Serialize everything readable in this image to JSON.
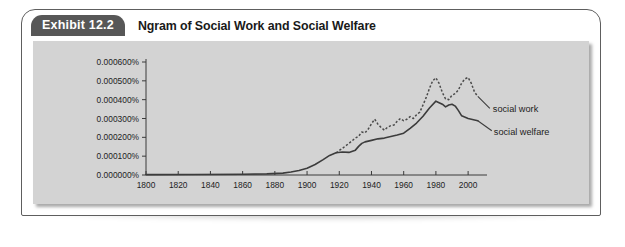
{
  "exhibit": {
    "tab_label": "Exhibit 12.2",
    "title": "Ngram of Social Work and Social Welfare"
  },
  "colors": {
    "card_background": "#ffffff",
    "card_border": "#5e5e5e",
    "tab_background": "#575757",
    "tab_text": "#ffffff",
    "panel_background": "#d3d3d3",
    "axis": "#3a3a3a",
    "social_welfare_line": "#3c3c3c",
    "social_work_line": "#4a4a4a"
  },
  "chart_data": {
    "type": "line",
    "title": "Ngram of Social Work and Social Welfare",
    "xlabel": "",
    "ylabel": "",
    "xlim": [
      1800,
      2008
    ],
    "ylim": [
      0,
      0.0006
    ],
    "grid": false,
    "legend_position": "right-inline-labels",
    "x_tick_labels": [
      "1800",
      "1820",
      "1840",
      "1860",
      "1880",
      "1900",
      "1920",
      "1940",
      "1960",
      "1980",
      "2000"
    ],
    "x_ticks": [
      1800,
      1820,
      1840,
      1860,
      1880,
      1900,
      1920,
      1940,
      1960,
      1980,
      2000
    ],
    "y_tick_labels": [
      "0.000000%",
      "0.000100%",
      "0.000200%",
      "0.000300%",
      "0.000400%",
      "0.000500%",
      "0.000600%"
    ],
    "y_ticks": [
      0,
      0.0001,
      0.0002,
      0.0003,
      0.0004,
      0.0005,
      0.0006
    ],
    "series": [
      {
        "name": "social work",
        "style": "dotted",
        "label": "social work",
        "x": [
          1918,
          1922,
          1926,
          1930,
          1932,
          1934,
          1936,
          1938,
          1940,
          1942,
          1944,
          1946,
          1948,
          1950,
          1952,
          1954,
          1956,
          1958,
          1960,
          1962,
          1964,
          1966,
          1968,
          1970,
          1972,
          1974,
          1976,
          1978,
          1980,
          1982,
          1984,
          1986,
          1988,
          1990,
          1992,
          1994,
          1996,
          1998,
          2000,
          2002,
          2004,
          2006
        ],
        "y": [
          0.000118,
          0.000142,
          0.000168,
          0.000196,
          0.000206,
          0.000228,
          0.000224,
          0.000244,
          0.000272,
          0.000296,
          0.00027,
          0.000252,
          0.000238,
          0.000254,
          0.000262,
          0.000266,
          0.000286,
          0.0003,
          0.000288,
          0.000296,
          0.00031,
          0.0003,
          0.00032,
          0.000334,
          0.000372,
          0.000412,
          0.00046,
          0.0005,
          0.000516,
          0.000486,
          0.000438,
          0.000404,
          0.0004,
          0.000424,
          0.000432,
          0.000452,
          0.000488,
          0.00051,
          0.000518,
          0.000486,
          0.00044,
          0.000418
        ]
      },
      {
        "name": "social welfare",
        "style": "solid",
        "label": "social welfare",
        "x": [
          1800,
          1830,
          1860,
          1875,
          1885,
          1890,
          1895,
          1900,
          1905,
          1910,
          1914,
          1918,
          1922,
          1926,
          1930,
          1932,
          1934,
          1936,
          1938,
          1940,
          1944,
          1948,
          1952,
          1956,
          1960,
          1964,
          1968,
          1972,
          1976,
          1980,
          1984,
          1986,
          1988,
          1990,
          1992,
          1994,
          1996,
          2000,
          2004,
          2006
        ],
        "y": [
          2e-06,
          3e-06,
          4e-06,
          6e-06,
          1e-05,
          1.6e-05,
          2.4e-05,
          3.6e-05,
          5.6e-05,
          8.2e-05,
          0.000104,
          0.000118,
          0.000122,
          0.00012,
          0.000132,
          0.000152,
          0.000168,
          0.000176,
          0.00018,
          0.000184,
          0.000192,
          0.000196,
          0.000204,
          0.000212,
          0.000222,
          0.000248,
          0.000276,
          0.000312,
          0.000356,
          0.000392,
          0.000376,
          0.000362,
          0.000372,
          0.000376,
          0.000366,
          0.000342,
          0.000314,
          0.0003,
          0.000292,
          0.000288
        ]
      }
    ]
  }
}
